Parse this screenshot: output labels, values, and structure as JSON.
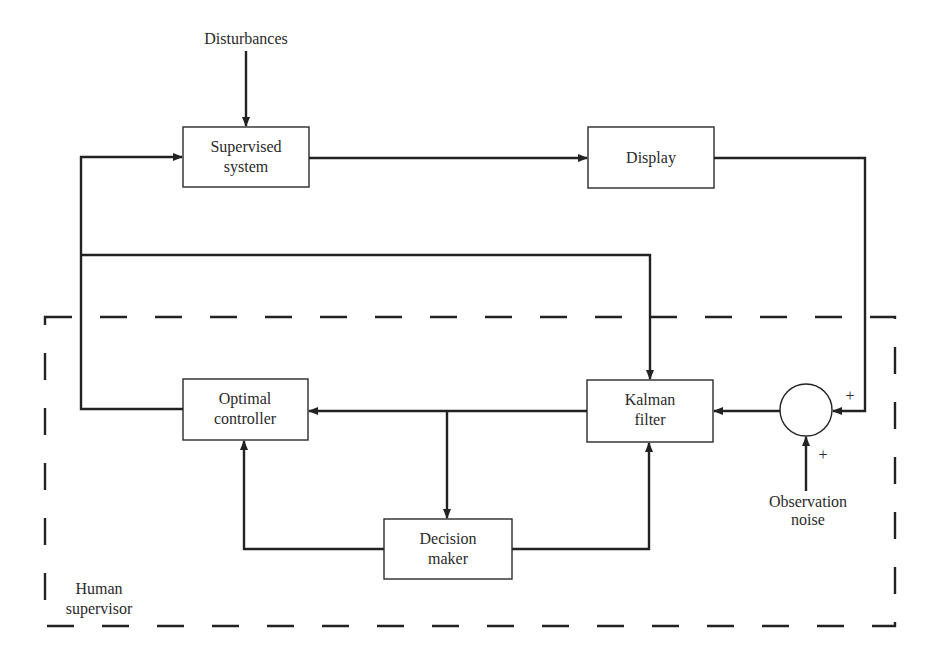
{
  "diagram": {
    "inputs": {
      "disturbances": "Disturbances",
      "observation_noise_line1": "Observation",
      "observation_noise_line2": "noise"
    },
    "blocks": {
      "supervised_system": {
        "line1": "Supervised",
        "line2": "system"
      },
      "display": {
        "line1": "Display"
      },
      "kalman_filter": {
        "line1": "Kalman",
        "line2": "filter"
      },
      "optimal_controller": {
        "line1": "Optimal",
        "line2": "controller"
      },
      "decision_maker": {
        "line1": "Decision",
        "line2": "maker"
      }
    },
    "summing_junction": {
      "sign_display": "+",
      "sign_noise": "+"
    },
    "group": {
      "line1": "Human",
      "line2": "supervisor"
    },
    "colors": {
      "line": "#222222",
      "background": "#ffffff"
    }
  }
}
